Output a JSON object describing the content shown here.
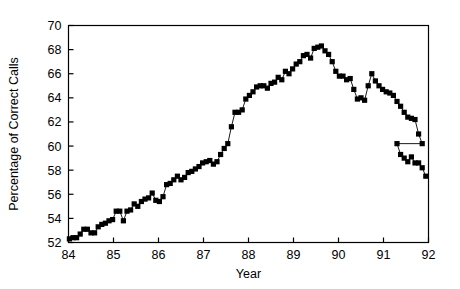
{
  "chart_data": {
    "type": "line",
    "title": "",
    "subtitle": "",
    "xlabel": "Year",
    "ylabel": "Percentage of Correct Calls",
    "xlim": [
      84,
      92
    ],
    "ylim": [
      52,
      70
    ],
    "xticks": [
      "84",
      "85",
      "86",
      "87",
      "88",
      "89",
      "90",
      "91",
      "92"
    ],
    "xtick_values": [
      84,
      85,
      86,
      87,
      88,
      89,
      90,
      91,
      92
    ],
    "yticks": [
      "52",
      "54",
      "56",
      "58",
      "60",
      "62",
      "64",
      "66",
      "68",
      "70"
    ],
    "ytick_values": [
      52,
      54,
      56,
      58,
      60,
      62,
      64,
      66,
      68,
      70
    ],
    "grid": false,
    "legend": null,
    "marker": "filled-square",
    "marker_color": "#000000",
    "line_color": "#000000",
    "series": [
      {
        "name": "Percentage of Correct Calls",
        "x": [
          84.02,
          84.1,
          84.18,
          84.26,
          84.34,
          84.42,
          84.5,
          84.58,
          84.66,
          84.74,
          84.82,
          84.9,
          84.98,
          85.06,
          85.14,
          85.22,
          85.3,
          85.38,
          85.46,
          85.54,
          85.62,
          85.7,
          85.78,
          85.86,
          85.94,
          86.02,
          86.1,
          86.18,
          86.26,
          86.34,
          86.42,
          86.5,
          86.58,
          86.66,
          86.74,
          86.82,
          86.9,
          86.98,
          87.06,
          87.14,
          87.22,
          87.3,
          87.38,
          87.46,
          87.54,
          87.62,
          87.7,
          87.78,
          87.86,
          87.94,
          88.02,
          88.1,
          88.18,
          88.26,
          88.34,
          88.42,
          88.5,
          88.58,
          88.66,
          88.74,
          88.82,
          88.9,
          88.98,
          89.06,
          89.14,
          89.22,
          89.3,
          89.38,
          89.46,
          89.54,
          89.62,
          89.7,
          89.78,
          89.86,
          89.94,
          90.02,
          90.1,
          90.18,
          90.26,
          90.34,
          90.42,
          90.5,
          90.58,
          90.66,
          90.74,
          90.82,
          90.9,
          90.98,
          91.06,
          91.14,
          91.22,
          91.3,
          91.38,
          91.46,
          91.54,
          91.62,
          91.7,
          91.78,
          91.86
        ],
        "values": [
          52.3,
          52.4,
          52.4,
          52.7,
          53.1,
          53.1,
          52.8,
          52.8,
          53.3,
          53.5,
          53.6,
          53.8,
          53.9,
          54.6,
          54.6,
          53.8,
          54.6,
          54.7,
          55.2,
          55.0,
          55.4,
          55.6,
          55.7,
          56.1,
          55.5,
          55.4,
          55.8,
          56.8,
          56.9,
          57.2,
          57.5,
          57.2,
          57.4,
          57.8,
          57.9,
          58.1,
          58.3,
          58.6,
          58.7,
          58.8,
          58.5,
          58.7,
          59.3,
          59.8,
          60.2,
          61.6,
          62.8,
          62.8,
          63.0,
          63.9,
          64.2,
          64.5,
          64.9,
          65.0,
          65.0,
          64.8,
          65.2,
          65.3,
          65.7,
          65.5,
          66.2,
          66.0,
          66.4,
          66.8,
          67.0,
          67.5,
          67.6,
          67.3,
          68.1,
          68.2,
          68.3,
          67.9,
          67.6,
          67.0,
          66.2,
          65.8,
          65.8,
          65.5,
          65.6,
          64.7,
          63.9,
          64.0,
          63.8,
          65.0,
          66.0,
          65.4,
          65.0,
          64.7,
          64.5,
          64.4,
          64.2,
          63.7,
          63.3,
          62.8,
          62.4,
          62.3,
          62.2,
          61.0,
          60.2
        ]
      }
    ]
  },
  "tail": {
    "x": [
      91.3,
      91.38,
      91.46,
      91.54,
      91.62,
      91.7,
      91.78,
      91.86,
      91.94
    ],
    "values": [
      60.2,
      59.3,
      59.0,
      58.7,
      59.1,
      58.6,
      58.6,
      58.2,
      57.5
    ]
  }
}
